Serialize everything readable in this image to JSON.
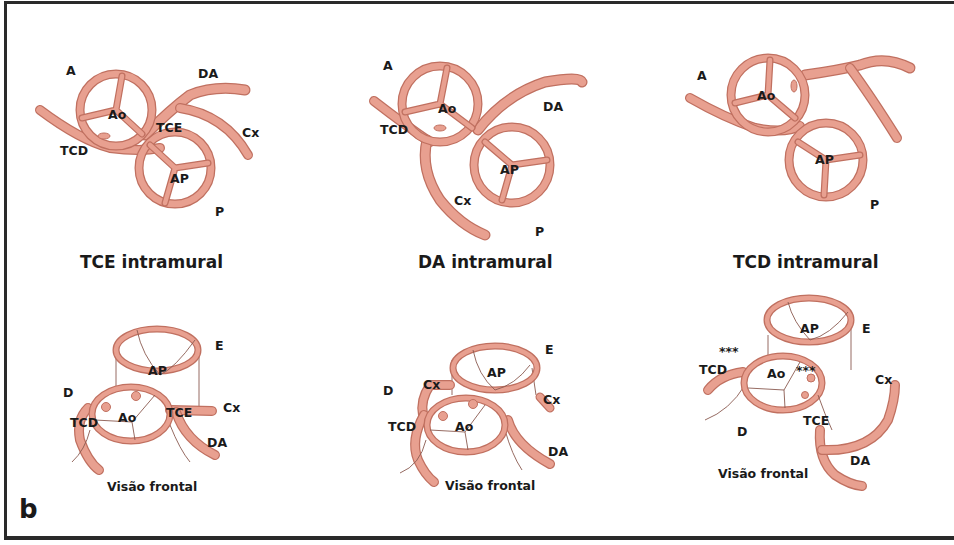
{
  "figure": {
    "panel_letter": "b",
    "colors": {
      "vessel_fill": "#e8a090",
      "vessel_stroke": "#c07060",
      "thin_line": "#8a5a50",
      "text": "#1a1a1a",
      "frame": "#2a2a2a"
    }
  },
  "panels_top": [
    {
      "title": "TCE intramural",
      "labels": {
        "A": "A",
        "DA": "DA",
        "Ao": "Ao",
        "TCE": "TCE",
        "TCD": "TCD",
        "Cx": "Cx",
        "AP": "AP",
        "P": "P"
      }
    },
    {
      "title": "DA intramural",
      "labels": {
        "A": "A",
        "DA": "DA",
        "Ao": "Ao",
        "TCD": "TCD",
        "Cx": "Cx",
        "AP": "AP",
        "P": "P"
      }
    },
    {
      "title": "TCD intramural",
      "labels": {
        "A": "A",
        "Ao": "Ao",
        "AP": "AP",
        "P": "P"
      }
    }
  ],
  "panels_bottom": [
    {
      "subtitle": "Visão frontal",
      "labels": {
        "E": "E",
        "AP": "AP",
        "D": "D",
        "Ao": "Ao",
        "TCD": "TCD",
        "TCE": "TCE",
        "Cx": "Cx",
        "DA": "DA"
      }
    },
    {
      "subtitle": "Visão frontal",
      "labels": {
        "E": "E",
        "AP": "AP",
        "D": "D",
        "Cx_left": "Cx",
        "Cx_right": "Cx",
        "TCD": "TCD",
        "Ao": "Ao",
        "DA": "DA"
      }
    },
    {
      "subtitle": "Visão frontal",
      "labels": {
        "AP": "AP",
        "E": "E",
        "stars_left": "***",
        "stars_right": "***",
        "TCD": "TCD",
        "Ao": "Ao",
        "Cx": "Cx",
        "TCE": "TCE",
        "D": "D",
        "DA": "DA"
      }
    }
  ]
}
